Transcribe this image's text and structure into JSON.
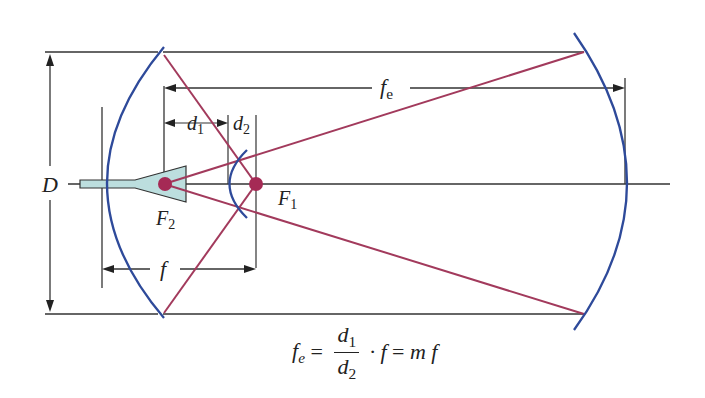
{
  "diagram": {
    "colors": {
      "mirror": "#2e4a9a",
      "ray": "#a23a5c",
      "focus_dot": "#a52a55",
      "dimension_line": "#333333",
      "eyepiece_fill": "#bcdede",
      "background": "#ffffff"
    },
    "labels": {
      "aperture": "D",
      "effective_focal_length": "f",
      "effective_focal_length_sub": "e",
      "d1": "d",
      "d1_sub": "1",
      "d2": "d",
      "d2_sub": "2",
      "primary_focus": "F",
      "primary_focus_sub": "1",
      "secondary_focus": "F",
      "secondary_focus_sub": "2",
      "focal_length": "f"
    },
    "formula": {
      "lhs": "f",
      "lhs_sub": "e",
      "equals1": " = ",
      "num": "d",
      "num_sub": "1",
      "den": "d",
      "den_sub": "2",
      "dot": "·",
      "f": "f",
      "equals2": " = ",
      "rhs": "m f"
    }
  }
}
